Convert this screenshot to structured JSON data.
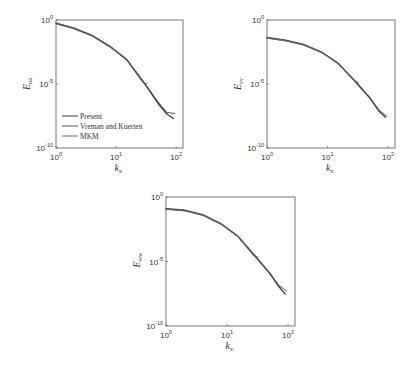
{
  "chart_data": [
    {
      "type": "line",
      "id": "Euu",
      "xscale": "log",
      "yscale": "log",
      "xlim": [
        1,
        130
      ],
      "ylim": [
        1e-10,
        1
      ],
      "xlabel": "k",
      "xlabel_sub": "x",
      "ylabel": "E",
      "ylabel_sub": "uu",
      "xticks": [
        {
          "base": "10",
          "exp": "0",
          "value": 1
        },
        {
          "base": "10",
          "exp": "1",
          "value": 10
        },
        {
          "base": "10",
          "exp": "2",
          "value": 100
        }
      ],
      "yticks": [
        {
          "base": "10",
          "exp": "0",
          "value": 1
        },
        {
          "base": "10",
          "exp": "-5",
          "value": 1e-05
        },
        {
          "base": "10",
          "exp": "-10",
          "value": 1e-10
        }
      ],
      "grid": false,
      "legend": {
        "position": "bottom-left",
        "entries": [
          "Present",
          "Vreman and Kuerten",
          "MKM"
        ]
      },
      "series": [
        {
          "name": "Present",
          "x": [
            1,
            2,
            4,
            8,
            15,
            30,
            50,
            70,
            90
          ],
          "y": [
            0.55,
            0.22,
            0.06,
            0.008,
            0.0008,
            1e-05,
            3e-07,
            4.5e-08,
            2e-08
          ]
        },
        {
          "name": "Vreman and Kuerten",
          "x": [
            1,
            2,
            4,
            8,
            15,
            30,
            50,
            70,
            95
          ],
          "y": [
            0.6,
            0.24,
            0.065,
            0.009,
            0.0009,
            1.2e-05,
            4e-07,
            6e-08,
            5e-08
          ]
        },
        {
          "name": "MKM",
          "x": [
            1,
            2,
            4,
            8,
            15,
            28,
            32
          ],
          "y": [
            0.5,
            0.2,
            0.055,
            0.0075,
            0.00075,
            1.3e-05,
            1.1e-05
          ]
        }
      ]
    },
    {
      "type": "line",
      "id": "Evv",
      "xscale": "log",
      "yscale": "log",
      "xlim": [
        1,
        130
      ],
      "ylim": [
        1e-10,
        1
      ],
      "xlabel": "k",
      "xlabel_sub": "x",
      "ylabel": "E",
      "ylabel_sub": "vv",
      "xticks": [
        {
          "base": "10",
          "exp": "0",
          "value": 1
        },
        {
          "base": "10",
          "exp": "1",
          "value": 10
        },
        {
          "base": "10",
          "exp": "2",
          "value": 100
        }
      ],
      "yticks": [
        {
          "base": "10",
          "exp": "0",
          "value": 1
        },
        {
          "base": "10",
          "exp": "-5",
          "value": 1e-05
        },
        {
          "base": "10",
          "exp": "-10",
          "value": 1e-10
        }
      ],
      "grid": false,
      "series": [
        {
          "name": "Present",
          "x": [
            1,
            2,
            4,
            8,
            15,
            30,
            50,
            70,
            90
          ],
          "y": [
            0.04,
            0.025,
            0.012,
            0.003,
            0.0004,
            1.2e-05,
            8e-07,
            8e-08,
            2.5e-08
          ]
        },
        {
          "name": "Vreman and Kuerten",
          "x": [
            1,
            2,
            4,
            8,
            15,
            30,
            50,
            70,
            95
          ],
          "y": [
            0.045,
            0.028,
            0.013,
            0.0032,
            0.00045,
            1.4e-05,
            9e-07,
            1e-07,
            3e-08
          ]
        },
        {
          "name": "MKM",
          "x": [
            1,
            2,
            4,
            8,
            15,
            28,
            32
          ],
          "y": [
            0.038,
            0.024,
            0.011,
            0.0028,
            0.00038,
            1.6e-05,
            1.4e-05
          ]
        }
      ]
    },
    {
      "type": "line",
      "id": "Eww",
      "xscale": "log",
      "yscale": "log",
      "xlim": [
        1,
        130
      ],
      "ylim": [
        1e-10,
        1
      ],
      "xlabel": "k",
      "xlabel_sub": "x",
      "ylabel": "E",
      "ylabel_sub": "ww",
      "xticks": [
        {
          "base": "10",
          "exp": "0",
          "value": 1
        },
        {
          "base": "10",
          "exp": "1",
          "value": 10
        },
        {
          "base": "10",
          "exp": "2",
          "value": 100
        }
      ],
      "yticks": [
        {
          "base": "10",
          "exp": "0",
          "value": 1
        },
        {
          "base": "10",
          "exp": "-5",
          "value": 1e-05
        },
        {
          "base": "10",
          "exp": "-10",
          "value": 1e-10
        }
      ],
      "grid": false,
      "series": [
        {
          "name": "Present",
          "x": [
            1,
            2,
            4,
            8,
            15,
            30,
            50,
            70,
            90
          ],
          "y": [
            0.12,
            0.09,
            0.04,
            0.008,
            0.0009,
            2e-05,
            1.2e-06,
            1.2e-07,
            3e-08
          ]
        },
        {
          "name": "Vreman and Kuerten",
          "x": [
            1,
            2,
            4,
            8,
            15,
            30,
            50,
            70,
            95
          ],
          "y": [
            0.13,
            0.1,
            0.045,
            0.009,
            0.001,
            2.4e-05,
            1.4e-06,
            1.5e-07,
            5e-08
          ]
        },
        {
          "name": "MKM",
          "x": [
            1,
            2,
            4,
            8,
            15,
            28,
            32
          ],
          "y": [
            0.11,
            0.085,
            0.038,
            0.0075,
            0.00085,
            2.5e-05,
            2.2e-05
          ]
        }
      ]
    }
  ],
  "colors": {
    "axis": "#555555",
    "series": [
      "#3a3a3a",
      "#555555",
      "#6a6a6a"
    ]
  }
}
